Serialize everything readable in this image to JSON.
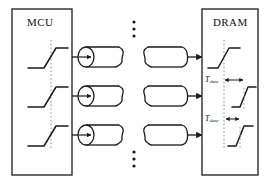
{
  "figure": {
    "type": "block-diagram",
    "background": "#ffffff",
    "line_color": "#1a1a1a",
    "dotted_ref_color": "#9a9a9a"
  },
  "blocks": [
    {
      "id": "mcu",
      "title": "MCU",
      "x": 12,
      "y": 9,
      "width": 60,
      "height": 166,
      "waveforms": [
        {
          "row": 1,
          "aligned": true,
          "skew_label": null
        },
        {
          "row": 2,
          "aligned": true,
          "skew_label": null
        },
        {
          "row": 3,
          "aligned": true,
          "skew_label": null
        }
      ]
    },
    {
      "id": "dram",
      "title": "DRAM",
      "x": 202,
      "y": 9,
      "width": 56,
      "height": 166,
      "waveforms": [
        {
          "row": 1,
          "aligned": true,
          "skew_label": null
        },
        {
          "row": 2,
          "aligned": false,
          "skew_label": "T",
          "skew_subscript": "skew"
        },
        {
          "row": 3,
          "aligned": false,
          "skew_label": "T",
          "skew_subscript": "skew"
        }
      ]
    }
  ],
  "channels": [
    {
      "index": 1,
      "center_y": 57,
      "has_source_arrow": true,
      "has_break": true,
      "has_dest_arrow": true
    },
    {
      "index": 2,
      "center_y": 96,
      "has_source_arrow": true,
      "has_break": true,
      "has_dest_arrow": true
    },
    {
      "index": 3,
      "center_y": 135,
      "has_source_arrow": true,
      "has_break": true,
      "has_dest_arrow": true
    }
  ],
  "ellipses": [
    {
      "id": "top-ellipsis",
      "x": 134,
      "y": 22,
      "dots": 3,
      "orientation": "vertical"
    },
    {
      "id": "bottom-ellipsis",
      "x": 134,
      "y": 152,
      "dots": 3,
      "orientation": "vertical"
    }
  ],
  "annotations": {
    "skew_rows": [
      {
        "row": 2,
        "label_text": "T",
        "label_subscript": "skew",
        "arrow": "double-headed",
        "magnitude": "larger"
      },
      {
        "row": 3,
        "label_text": "T",
        "label_subscript": "skew",
        "arrow": "double-headed",
        "magnitude": "smaller"
      }
    ]
  }
}
